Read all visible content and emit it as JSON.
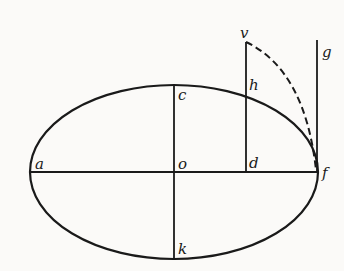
{
  "diagram": {
    "labels": {
      "a": "a",
      "o": "o",
      "d": "d",
      "f": "f",
      "c": "c",
      "h": "h",
      "k": "k",
      "v": "v",
      "g": "g"
    },
    "colors": {
      "ink": "#1a1a1a",
      "paper": "#fbfaf8"
    }
  }
}
